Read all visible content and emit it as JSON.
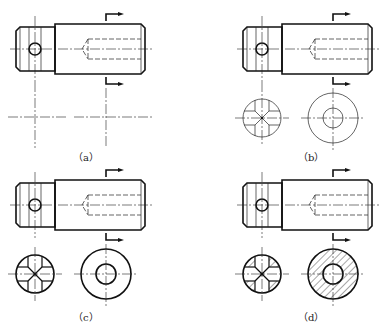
{
  "figure": {
    "panels": [
      {
        "id": "a",
        "label": "（a）",
        "description": "Shaft main view with section positions marked; centerlines for sections"
      },
      {
        "id": "b",
        "label": "（b）",
        "description": "Thin-line draft of the two cross sections"
      },
      {
        "id": "c",
        "label": "（c）",
        "description": "Cross sections outlined with thick lines"
      },
      {
        "id": "d",
        "label": "（d）",
        "description": "Completed cross sections with section hatching"
      }
    ]
  },
  "colors": {
    "line": "#111111",
    "background": "#ffffff"
  }
}
